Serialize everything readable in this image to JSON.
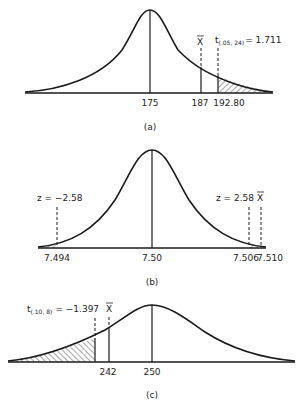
{
  "figures": [
    {
      "id": "a",
      "caption": "(a)",
      "mean_label": "175",
      "xbar_value_label": "187",
      "critical_value_label": "192.80",
      "xbar_symbol": "X",
      "critical_stat_main": "t",
      "critical_stat_sub": "(.05, 24)",
      "critical_stat_value": "= 1.711",
      "shaded_tail": "right"
    },
    {
      "id": "b",
      "caption": "(b)",
      "mean_label": "7.50",
      "lower_critical_label": "z = −2.58",
      "upper_critical_label": "z = 2.58",
      "xbar_symbol": "X",
      "lower_value_label": "7.494",
      "upper_value_label": "7.506",
      "xbar_value_label": "7.510",
      "shaded_tail": "both"
    },
    {
      "id": "c",
      "caption": "(c)",
      "mean_label": "250",
      "xbar_value_label": "242",
      "xbar_symbol": "X",
      "critical_stat_main": "t",
      "critical_stat_sub": "(.10, 8)",
      "critical_stat_value": "= −1.397",
      "shaded_tail": "left"
    }
  ]
}
